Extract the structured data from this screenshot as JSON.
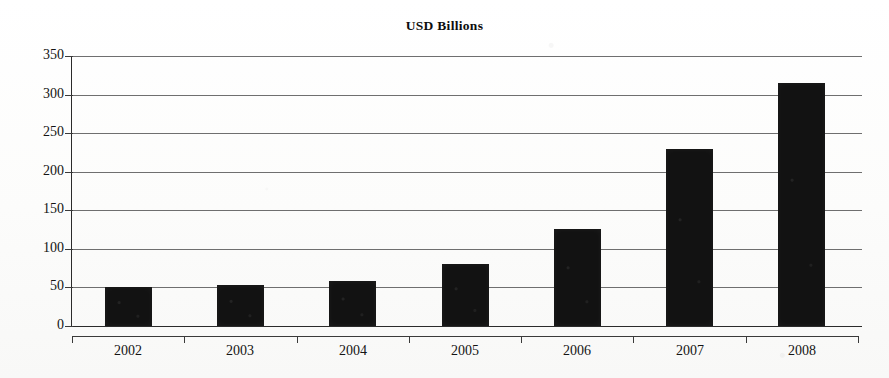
{
  "chart_data": {
    "type": "bar",
    "title": "USD Billions",
    "xlabel": "",
    "ylabel": "",
    "categories": [
      "2002",
      "2003",
      "2004",
      "2005",
      "2006",
      "2007",
      "2008"
    ],
    "values": [
      50,
      53,
      58,
      81,
      126,
      230,
      315
    ],
    "series": [
      {
        "name": "USD Billions",
        "values": [
          50,
          53,
          58,
          81,
          126,
          230,
          315
        ]
      }
    ],
    "ylim": [
      0,
      350
    ],
    "yticks": [
      0,
      50,
      100,
      150,
      200,
      250,
      300,
      350
    ],
    "ytick_labels": [
      "0",
      "50",
      "100",
      "150",
      "200",
      "250",
      "300",
      "350"
    ],
    "grid": true,
    "grid_axis": "y",
    "legend": false,
    "legend_position": "none",
    "bar_color": "#121212",
    "gridline_color": "#6f6f6f",
    "axis_color": "#2b2b2b",
    "background_color": "#fdfdfc",
    "text_color": "#141414"
  }
}
